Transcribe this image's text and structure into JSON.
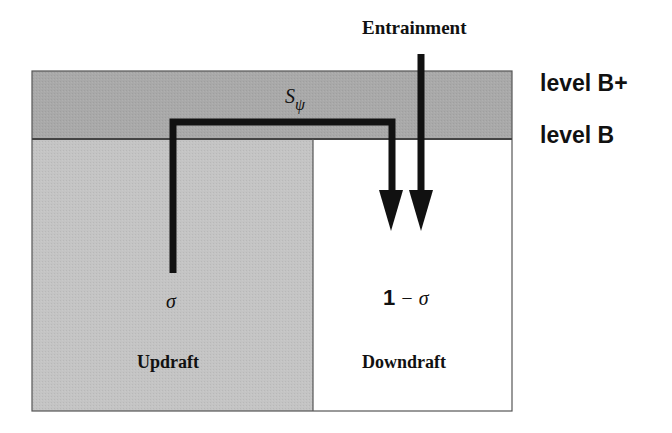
{
  "diagram": {
    "title": "Entrainment",
    "levels": [
      {
        "label": "level B+"
      },
      {
        "label": "level B"
      }
    ],
    "flux_label": {
      "main": "S",
      "subscript": "ψ"
    },
    "regions": [
      {
        "name": "Updraft",
        "fraction": "σ",
        "fill": "#c4c4c4"
      },
      {
        "name": "Downdraft",
        "fraction_prefix": "1",
        "fraction_rest": " − σ",
        "fill": "#ffffff"
      }
    ],
    "colors": {
      "layer_fill": "#a9a9a9",
      "updraft_fill": "#c4c4c4",
      "downdraft_fill": "#ffffff",
      "line": "#111111",
      "border": "#555555"
    }
  }
}
